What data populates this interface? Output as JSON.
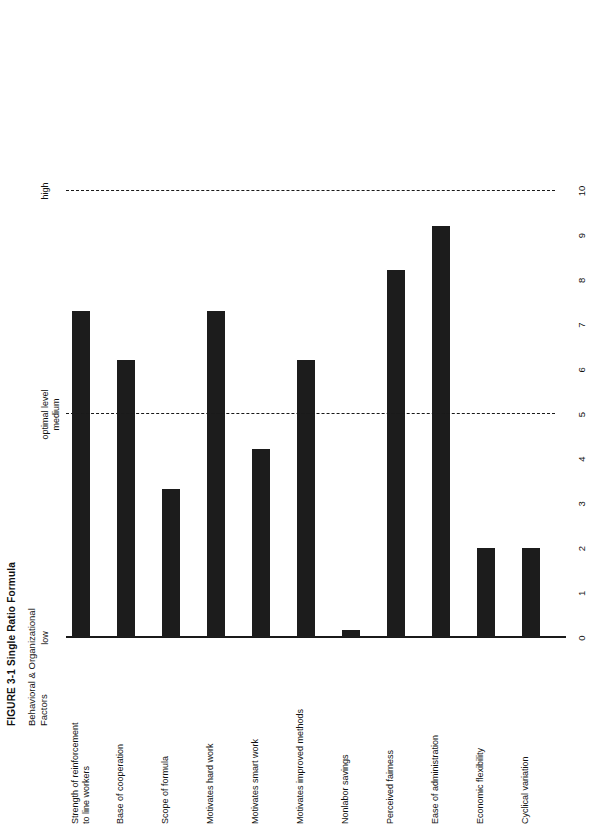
{
  "figure": {
    "title": "FIGURE 3-1  Single Ratio Formula",
    "axis_group_title": "Behavioral & Organizational\nFactors"
  },
  "reference_lines": [
    {
      "name": "low",
      "label": "low",
      "value": 0
    },
    {
      "name": "optimal",
      "label": "optimal level\nmedium",
      "value": 5
    },
    {
      "name": "high",
      "label": "high",
      "value": 10
    }
  ],
  "chart_data": {
    "type": "bar",
    "orientation": "horizontal",
    "title": "FIGURE 3-1  Single Ratio Formula",
    "xlabel": "",
    "ylabel": "Behavioral & Organizational Factors",
    "xlim": [
      0,
      10
    ],
    "grid": false,
    "legend": "none",
    "ticks": [
      "0",
      "1",
      "2",
      "3",
      "4",
      "5",
      "6",
      "7",
      "8",
      "9",
      "10"
    ],
    "annotations": [
      "low",
      "optimal level medium",
      "high"
    ],
    "categories": [
      "Strength of reinforcement\nto line workers",
      "Base of cooperation",
      "Scope of formula",
      "Motivates hard work",
      "Motivates smart work",
      "Motivates improved methods",
      "Nonlabor savings",
      "Perceived fairness",
      "Ease of administration",
      "Economic flexibility",
      "Cyclical variation"
    ],
    "values": [
      7.3,
      6.2,
      3.3,
      7.3,
      4.2,
      6.2,
      0.15,
      8.2,
      9.2,
      2.0,
      2.0
    ]
  }
}
